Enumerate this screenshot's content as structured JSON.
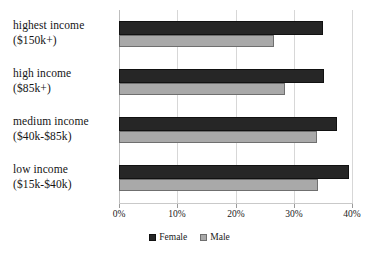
{
  "chart_data": {
    "type": "bar",
    "orientation": "horizontal",
    "title": "",
    "xlabel": "",
    "ylabel": "",
    "xlim": [
      0,
      40
    ],
    "xticks": [
      "0%",
      "10%",
      "20%",
      "30%",
      "40%"
    ],
    "xtick_values": [
      0,
      10,
      20,
      30,
      40
    ],
    "grid": true,
    "legend_position": "bottom-center",
    "categories": [
      {
        "line1": "highest income",
        "line2": "($150k+)"
      },
      {
        "line1": "high income",
        "line2": "($85k+)"
      },
      {
        "line1": "medium income",
        "line2": "($40k-$85k)"
      },
      {
        "line1": "low income",
        "line2": "($15k-$40k)"
      }
    ],
    "category_labels": [
      "highest income ($150k+)",
      "high income ($85k+)",
      "medium income ($40k-$85k)",
      "low income ($15k-$40k)"
    ],
    "series": [
      {
        "name": "Female",
        "color": "#262626",
        "values": [
          34.9,
          35.0,
          37.3,
          39.3
        ]
      },
      {
        "name": "Male",
        "color": "#a9a9a9",
        "values": [
          26.5,
          28.4,
          33.8,
          34.0
        ]
      }
    ]
  },
  "legend": {
    "items": [
      {
        "label": "Female",
        "color": "#262626"
      },
      {
        "label": "Male",
        "color": "#a9a9a9"
      }
    ]
  },
  "colors": {
    "female": "#262626",
    "male": "#a9a9a9",
    "gridline": "#d7d7d7",
    "axis": "#bdbdbd",
    "background": "#ffffff",
    "text": "#1a1a1a"
  }
}
